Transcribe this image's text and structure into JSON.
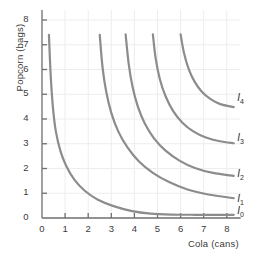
{
  "chart_data": {
    "type": "line",
    "title": "",
    "xlabel": "Cola (cans)",
    "ylabel": "Popcorn (bags)",
    "xlim": [
      0,
      8.6
    ],
    "ylim": [
      0,
      8.4
    ],
    "xticks": [
      "0",
      "1",
      "2",
      "3",
      "4",
      "5",
      "6",
      "7",
      "8"
    ],
    "yticks": [
      "0",
      "1",
      "2",
      "3",
      "4",
      "5",
      "6",
      "7",
      "8"
    ],
    "grid": true,
    "legend_position": "inline-right",
    "curve_color": "#8c8c8c",
    "axis_color": "#6e6e6e",
    "grid_color": "#ededed",
    "series": [
      {
        "name": "I0",
        "label": "I",
        "sub": "0",
        "label_x": 8.45,
        "label_y": 0.25,
        "points": [
          [
            0.3,
            7.4
          ],
          [
            0.38,
            5.7
          ],
          [
            0.48,
            4.4
          ],
          [
            0.6,
            3.5
          ],
          [
            0.8,
            2.7
          ],
          [
            1.05,
            2.1
          ],
          [
            1.4,
            1.55
          ],
          [
            1.85,
            1.1
          ],
          [
            2.4,
            0.75
          ],
          [
            3.1,
            0.48
          ],
          [
            3.9,
            0.28
          ],
          [
            4.7,
            0.18
          ],
          [
            5.6,
            0.14
          ],
          [
            6.6,
            0.13
          ],
          [
            8.3,
            0.13
          ]
        ]
      },
      {
        "name": "I1",
        "label": "I",
        "sub": "1",
        "label_x": 8.45,
        "label_y": 0.72,
        "points": [
          [
            2.5,
            7.4
          ],
          [
            2.62,
            6.1
          ],
          [
            2.78,
            5.1
          ],
          [
            3.0,
            4.25
          ],
          [
            3.3,
            3.5
          ],
          [
            3.7,
            2.85
          ],
          [
            4.2,
            2.28
          ],
          [
            4.8,
            1.82
          ],
          [
            5.5,
            1.45
          ],
          [
            6.3,
            1.15
          ],
          [
            7.2,
            0.95
          ],
          [
            8.3,
            0.8
          ]
        ]
      },
      {
        "name": "I2",
        "label": "I",
        "sub": "2",
        "label_x": 8.45,
        "label_y": 1.75,
        "points": [
          [
            3.62,
            7.42
          ],
          [
            3.75,
            6.25
          ],
          [
            3.92,
            5.3
          ],
          [
            4.15,
            4.5
          ],
          [
            4.45,
            3.82
          ],
          [
            4.85,
            3.22
          ],
          [
            5.35,
            2.72
          ],
          [
            5.95,
            2.32
          ],
          [
            6.62,
            2.02
          ],
          [
            7.4,
            1.82
          ],
          [
            8.3,
            1.7
          ]
        ]
      },
      {
        "name": "I3",
        "label": "I",
        "sub": "3",
        "label_x": 8.45,
        "label_y": 3.2,
        "points": [
          [
            4.8,
            7.42
          ],
          [
            4.92,
            6.45
          ],
          [
            5.1,
            5.62
          ],
          [
            5.35,
            4.92
          ],
          [
            5.68,
            4.32
          ],
          [
            6.08,
            3.85
          ],
          [
            6.55,
            3.5
          ],
          [
            7.1,
            3.25
          ],
          [
            7.7,
            3.1
          ],
          [
            8.3,
            3.02
          ]
        ]
      },
      {
        "name": "I4",
        "label": "I",
        "sub": "4",
        "label_x": 8.45,
        "label_y": 4.8,
        "points": [
          [
            6.0,
            7.42
          ],
          [
            6.14,
            6.7
          ],
          [
            6.34,
            6.05
          ],
          [
            6.6,
            5.52
          ],
          [
            6.92,
            5.1
          ],
          [
            7.3,
            4.8
          ],
          [
            7.72,
            4.6
          ],
          [
            8.3,
            4.48
          ]
        ]
      }
    ]
  }
}
